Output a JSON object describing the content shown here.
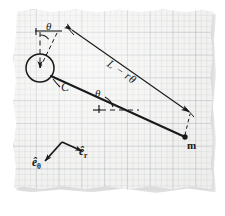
{
  "figure": {
    "kind": "physics-free-body-diagram",
    "medium": "torn graph paper sheet",
    "colors": {
      "ink": "#1a1a1a",
      "paper": "#f2f2f0",
      "grid_major": "#969eaa",
      "grid_minor": "#b4bcc6",
      "page_background": "#ffffff",
      "paper_shadow": "#c9c9c9"
    },
    "labels": {
      "theta_top": "θ",
      "theta_mid": "θ",
      "spool_center": "C",
      "string_length": "L − rθ",
      "mass": "m",
      "unit_vector_r": "ê",
      "unit_vector_r_sub": "r",
      "unit_vector_theta": "ê",
      "unit_vector_theta_sub": "θ"
    },
    "geometry": {
      "spool_center_px": [
        40,
        68
      ],
      "spool_radius_px": 14,
      "tangent_point_px": [
        51,
        76
      ],
      "mass_point_px": [
        185,
        137
      ],
      "string_angle_deg": 29,
      "dimension_arrow_start_px": [
        70,
        28
      ],
      "dimension_arrow_end_px": [
        191,
        113
      ],
      "horizontal_dash_y_px": 110,
      "unit_vector_origin_px": [
        62,
        142
      ]
    }
  }
}
